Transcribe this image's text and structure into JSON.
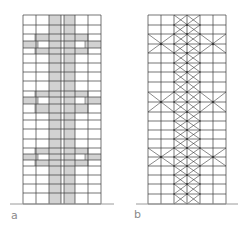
{
  "figure": {
    "panels": [
      {
        "id": "a",
        "label": "a",
        "style": "shaded-core-with-outriggers",
        "columns_x": [
          23,
          36,
          49,
          61,
          64,
          75,
          88,
          101
        ],
        "core_bands_x": [
          [
            49,
            61
          ],
          [
            64,
            75
          ]
        ],
        "rows_y": [
          15,
          25,
          34,
          41,
          48,
          54,
          63,
          72,
          81,
          91,
          97,
          104,
          113,
          120,
          129,
          139,
          148,
          154,
          160,
          166,
          175,
          184,
          193,
          204
        ],
        "outriggers": [
          {
            "top": 34,
            "mid1": 41,
            "mid2": 48,
            "bottom": 54
          },
          {
            "top": 91,
            "mid1": 97,
            "mid2": 104,
            "bottom": 113
          },
          {
            "top": 148,
            "mid1": 154,
            "mid2": 160,
            "bottom": 166
          }
        ],
        "outrigger_inner_x": [
          36,
          88
        ],
        "outrigger_step_x": [
          38,
          85
        ],
        "ground": {
          "x1": 10,
          "x2": 114,
          "y": 204
        }
      },
      {
        "id": "b",
        "label": "b",
        "style": "braced-core-with-outriggers",
        "columns_x": [
          148,
          161,
          174,
          187,
          200,
          213,
          226
        ],
        "core_x": [
          174,
          200
        ],
        "rows_y": [
          15,
          25,
          34,
          44,
          53,
          63,
          72,
          82,
          92,
          102,
          112,
          121,
          130,
          139,
          148,
          157,
          166,
          175,
          184,
          194,
          204
        ],
        "outriggers": [
          {
            "top": 34,
            "center": 44,
            "bottom": 53
          },
          {
            "top": 92,
            "center": 102,
            "bottom": 112
          },
          {
            "top": 148,
            "center": 157,
            "bottom": 166
          }
        ],
        "ground": {
          "x1": 136,
          "x2": 238,
          "y": 204
        }
      }
    ],
    "colors": {
      "line": "#3a3a3a",
      "shade": "#d2d2d2",
      "ground": "#9a9a9a",
      "label": "#8a8a8a"
    }
  },
  "labels": {
    "a": "a",
    "b": "b"
  }
}
